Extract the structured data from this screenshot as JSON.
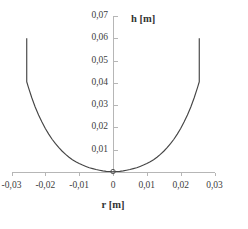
{
  "chart_data": {
    "type": "line",
    "title": "",
    "subtitle": "",
    "xlabel": "r [m]",
    "ylabel": "h [m]",
    "xlim": [
      -0.03,
      0.03
    ],
    "ylim": [
      0.0,
      0.07
    ],
    "grid": false,
    "legend": null,
    "legend_position": "none",
    "x_ticks": [
      -0.03,
      -0.02,
      -0.01,
      0,
      0.01,
      0.02,
      0.03
    ],
    "x_tick_labels": [
      "-0,03",
      "-0,02",
      "-0,01",
      "0",
      "0,01",
      "0,02",
      "0,03"
    ],
    "y_ticks": [
      0.01,
      0.02,
      0.03,
      0.04,
      0.05,
      0.06,
      0.07
    ],
    "y_tick_labels": [
      "0,01",
      "0,02",
      "0,03",
      "0,04",
      "0,05",
      "0,06",
      "0,07"
    ],
    "series": [
      {
        "name": "h(r)",
        "color": "#454545",
        "x": [
          -0.0255,
          -0.0255,
          -0.025,
          -0.024,
          -0.023,
          -0.022,
          -0.021,
          -0.02,
          -0.019,
          -0.018,
          -0.017,
          -0.016,
          -0.015,
          -0.014,
          -0.013,
          -0.012,
          -0.011,
          -0.01,
          -0.009,
          -0.008,
          -0.007,
          -0.006,
          -0.005,
          -0.004,
          -0.003,
          -0.002,
          -0.001,
          0.0,
          0.001,
          0.002,
          0.003,
          0.004,
          0.005,
          0.006,
          0.007,
          0.008,
          0.009,
          0.01,
          0.011,
          0.012,
          0.013,
          0.014,
          0.015,
          0.016,
          0.017,
          0.018,
          0.019,
          0.02,
          0.021,
          0.022,
          0.023,
          0.024,
          0.025,
          0.0255,
          0.0255
        ],
        "y": [
          0.06,
          0.0405,
          0.038,
          0.0333,
          0.0292,
          0.0256,
          0.0224,
          0.0195,
          0.017,
          0.0147,
          0.0127,
          0.0109,
          0.0093,
          0.0079,
          0.0066,
          0.0055,
          0.0046,
          0.0038,
          0.0031,
          0.0025,
          0.0019,
          0.0015,
          0.0011,
          0.0008,
          0.0005,
          0.0003,
          0.0002,
          0.0001,
          0.0002,
          0.0003,
          0.0005,
          0.0008,
          0.0011,
          0.0015,
          0.0019,
          0.0025,
          0.0031,
          0.0038,
          0.0046,
          0.0055,
          0.0066,
          0.0079,
          0.0093,
          0.0109,
          0.0127,
          0.0147,
          0.017,
          0.0195,
          0.0224,
          0.0256,
          0.0292,
          0.0333,
          0.038,
          0.0405,
          0.06
        ]
      }
    ],
    "annotations": [
      {
        "name": "minimum-marker",
        "x": 0.0,
        "y": 0.0002
      }
    ],
    "colors": {
      "curve": "#454545",
      "axis": "#b6b6b6",
      "text": "#3d3d3d",
      "background": "#ffffff"
    }
  }
}
